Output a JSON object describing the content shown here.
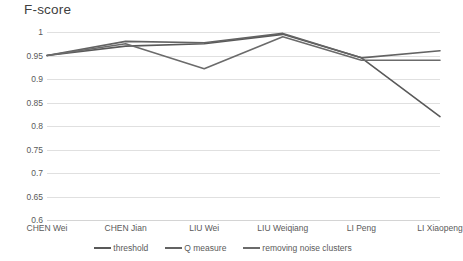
{
  "chart_data": {
    "type": "line",
    "title": "F-score",
    "xlabel": "",
    "ylabel": "",
    "ylim": [
      0.6,
      1.0
    ],
    "ytick_step": 0.05,
    "yticks": [
      "1",
      "0.95",
      "0.9",
      "0.85",
      "0.8",
      "0.75",
      "0.7",
      "0.65",
      "0.6"
    ],
    "ytick_values": [
      1,
      0.95,
      0.9,
      0.85,
      0.8,
      0.75,
      0.7,
      0.65,
      0.6
    ],
    "grid": true,
    "legend_position": "bottom-center",
    "categories": [
      "CHEN Wei",
      "CHEN Jian",
      "LIU Wei",
      "LIU Weiqiang",
      "LI Peng",
      "LI Xiaopeng"
    ],
    "series": [
      {
        "name": "threshold",
        "color": "#595959",
        "values": [
          0.95,
          0.97,
          0.975,
          0.995,
          0.945,
          0.82
        ]
      },
      {
        "name": "Q measure",
        "color": "#636363",
        "values": [
          0.95,
          0.98,
          0.977,
          0.997,
          0.945,
          0.96
        ]
      },
      {
        "name": "removing noise clusters",
        "color": "#6b6b6b",
        "values": [
          0.95,
          0.975,
          0.922,
          0.99,
          0.94,
          0.94
        ]
      }
    ]
  },
  "colors": {
    "background": "#ffffff",
    "gridline": "#e0e0e0",
    "text": "#5a5a5a",
    "title_text": "#404040"
  }
}
